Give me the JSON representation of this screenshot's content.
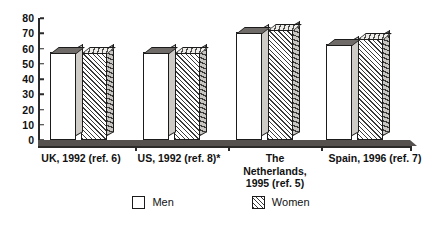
{
  "chart_data": {
    "type": "bar",
    "title": "",
    "xlabel": "",
    "ylabel": "",
    "ylim": [
      0,
      80
    ],
    "yticks": [
      0,
      10,
      20,
      30,
      40,
      50,
      60,
      70,
      80
    ],
    "grid": false,
    "legend_position": "bottom-center",
    "style": "3d-grouped-bar",
    "categories": [
      "UK, 1992 (ref. 6)",
      "US, 1992 (ref. 8)*",
      "The Netherlands, 1995 (ref. 5)",
      "Spain, 1996 (ref. 7)"
    ],
    "category_lines": [
      [
        "UK, 1992 (ref. 6)"
      ],
      [
        "US, 1992 (ref. 8)*"
      ],
      [
        "The",
        "Netherlands,",
        "1995 (ref. 5)"
      ],
      [
        "Spain, 1996 (ref. 7)"
      ]
    ],
    "series": [
      {
        "name": "Men",
        "values": [
          58,
          58,
          71,
          63
        ]
      },
      {
        "name": "Women",
        "values": [
          58,
          58,
          73,
          67
        ]
      }
    ],
    "colors": {
      "men_fill": "#ffffff",
      "women_fill": "#ffffff",
      "women_hatch": "#3a3a3a",
      "outline": "#1b1b1b",
      "top_face": "#6f6b68",
      "floor": "#55514e",
      "axis": "#2a2a2a",
      "text": "#111111"
    }
  },
  "legend": {
    "items": [
      {
        "label": "Men",
        "swatch": "white-square"
      },
      {
        "label": "Women",
        "swatch": "hatched-square"
      }
    ]
  }
}
